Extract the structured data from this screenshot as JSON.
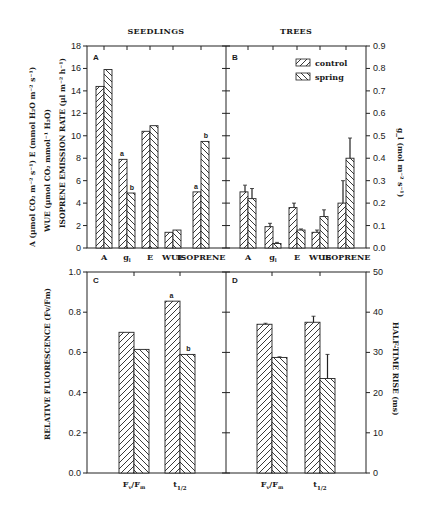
{
  "figure": {
    "column_titles": [
      "SEEDLINGS",
      "TREES"
    ],
    "legend": [
      {
        "label": "control",
        "pattern": "hatch-forward"
      },
      {
        "label": "spring",
        "pattern": "hatch-back"
      }
    ]
  },
  "chart_data": [
    {
      "panel": "A",
      "type": "bar",
      "group": "SEEDLINGS",
      "categories": [
        "A",
        "g_l",
        "E",
        "WUE",
        "ISOPRENE"
      ],
      "category_labels": [
        "A",
        "g",
        "E",
        "WUE",
        "ISOPRENE"
      ],
      "series": [
        {
          "name": "control",
          "values": [
            14.4,
            7.9,
            10.4,
            1.4,
            5.0
          ]
        },
        {
          "name": "spring",
          "values": [
            15.9,
            4.9,
            10.9,
            1.6,
            9.5
          ]
        }
      ],
      "annotations": [
        {
          "category": "g_l",
          "series": "control",
          "text": "a"
        },
        {
          "category": "g_l",
          "series": "spring",
          "text": "b"
        },
        {
          "category": "ISOPRENE",
          "series": "control",
          "text": "a"
        },
        {
          "category": "ISOPRENE",
          "series": "spring",
          "text": "b"
        }
      ],
      "ylim": [
        0,
        18
      ],
      "yticks": [
        0,
        2,
        4,
        6,
        8,
        10,
        12,
        14,
        16,
        18
      ],
      "ylabel_lines": [
        "A (µmol CO₂ m⁻² s⁻¹) E (mmol H₂O m⁻² s⁻¹)",
        "WUE (µmol CO₂ mmol⁻¹ H₂O)",
        "ISOPRENE EMISSION RATE (µl m⁻² h⁻¹)"
      ]
    },
    {
      "panel": "B",
      "type": "bar",
      "group": "TREES",
      "categories": [
        "A",
        "g_l",
        "E",
        "WUE",
        "ISOPRENE"
      ],
      "category_labels": [
        "A",
        "g",
        "E",
        "WUE",
        "ISOPRENE"
      ],
      "series": [
        {
          "name": "control",
          "values": [
            0.25,
            0.095,
            0.18,
            0.07,
            0.2
          ],
          "error": [
            0.03,
            0.015,
            0.02,
            0.01,
            0.1
          ]
        },
        {
          "name": "spring",
          "values": [
            0.22,
            0.02,
            0.08,
            0.14,
            0.4
          ],
          "error": [
            0.045,
            0.005,
            0.005,
            0.03,
            0.09
          ]
        }
      ],
      "ylim": [
        0,
        0.9
      ],
      "yticks": [
        0.0,
        0.1,
        0.2,
        0.3,
        0.4,
        0.5,
        0.6,
        0.7,
        0.8,
        0.9
      ],
      "ylabel": "g_l (mol m⁻² s⁻¹)",
      "legend_position": "upper right"
    },
    {
      "panel": "C",
      "type": "bar",
      "group": "SEEDLINGS",
      "categories": [
        "Fv/Fm",
        "t1/2"
      ],
      "series": [
        {
          "name": "control",
          "values": [
            0.7,
            0.855
          ]
        },
        {
          "name": "spring",
          "values": [
            0.615,
            0.59
          ]
        }
      ],
      "annotations": [
        {
          "category": "t1/2",
          "series": "control",
          "text": "a"
        },
        {
          "category": "t1/2",
          "series": "spring",
          "text": "b"
        }
      ],
      "ylim": [
        0,
        1.0
      ],
      "yticks": [
        0.0,
        0.2,
        0.4,
        0.6,
        0.8,
        1.0
      ],
      "ylabel": "RELATIVE FLUORESCENCE (Fv/Fm)"
    },
    {
      "panel": "D",
      "type": "bar",
      "group": "TREES",
      "categories": [
        "Fv/Fm",
        "t1/2"
      ],
      "series": [
        {
          "name": "control",
          "values": [
            0.74,
            0.75
          ],
          "error": [
            0.005,
            0.03
          ]
        },
        {
          "name": "spring",
          "values": [
            0.575,
            0.47
          ],
          "error": [
            0.003,
            0.12
          ]
        }
      ],
      "ylim": [
        0,
        50
      ],
      "yticks": [
        0,
        10,
        20,
        30,
        40,
        50
      ],
      "ylabel": "HALF-TIME RISE (ms)",
      "note": "Bar heights expressed on left (0-1.0) scale; right axis ms scale 0-50"
    }
  ]
}
